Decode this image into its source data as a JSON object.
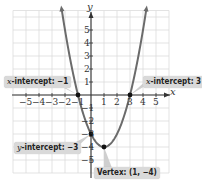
{
  "chart_data": {
    "type": "line",
    "title": "",
    "function": "y = x^2 - 2x - 3",
    "xlabel": "x",
    "ylabel": "y",
    "xlim": [
      -6,
      6
    ],
    "ylim": [
      -6,
      6.5
    ],
    "grid": true,
    "x_ticks": [
      "−5",
      "−4",
      "−3",
      "−2",
      "−1",
      "1",
      "2",
      "3",
      "4",
      "5"
    ],
    "y_ticks": [
      "5",
      "4",
      "3",
      "2",
      "1",
      "−1",
      "−2",
      "−3",
      "−4",
      "−5"
    ],
    "series": [
      {
        "name": "parabola",
        "x": [
          -2,
          -1.5,
          -1,
          -0.5,
          0,
          0.5,
          1,
          1.5,
          2,
          2.5,
          3,
          3.5,
          4
        ],
        "y": [
          5,
          2.25,
          0,
          -1.75,
          -3,
          -3.75,
          -4,
          -3.75,
          -3,
          -1.75,
          0,
          2.25,
          5
        ],
        "color": "#6b6b6b"
      }
    ],
    "points": [
      {
        "name": "x-intercept",
        "x": -1,
        "y": 0
      },
      {
        "name": "x-intercept",
        "x": 3,
        "y": 0
      },
      {
        "name": "y-intercept",
        "x": 0,
        "y": -3
      },
      {
        "name": "vertex",
        "x": 1,
        "y": -4
      }
    ],
    "annotations": [
      {
        "var": "x",
        "text": "-intercept: −1"
      },
      {
        "var": "x",
        "text": "-intercept: 3"
      },
      {
        "var": "y",
        "text": "-intercept: −3"
      },
      {
        "var": "",
        "text": "Vertex: (1, −4)"
      }
    ]
  },
  "labels": {
    "x_intercept_left_var": "x",
    "x_intercept_left_text": "-intercept: −1",
    "x_intercept_right_var": "x",
    "x_intercept_right_text": "-intercept: 3",
    "y_intercept_var": "y",
    "y_intercept_text": "-intercept: −3",
    "vertex_text": "Vertex: (1, −4)",
    "x_axis_name": "x",
    "y_axis_name": "y"
  },
  "colors": {
    "grid": "#dcdcdc",
    "axis": "#333333",
    "curve": "#6b6b6b",
    "point": "#111111",
    "label_bg": "#d9d9d9"
  }
}
